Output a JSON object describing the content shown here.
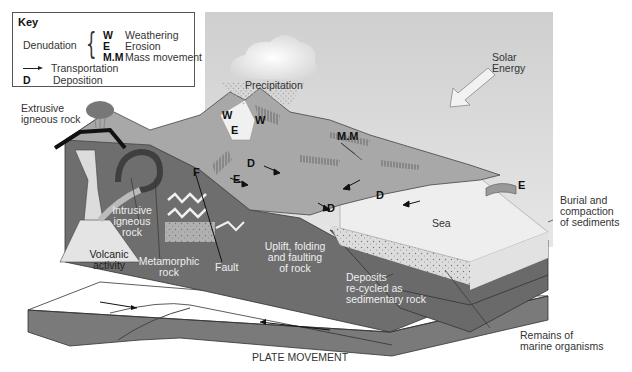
{
  "key": {
    "title": "Key",
    "denudation_label": "Denudation",
    "denudation_items": [
      {
        "symbol": "W",
        "label": "Weathering"
      },
      {
        "symbol": "E",
        "label": "Erosion"
      },
      {
        "symbol": "M.M",
        "label": "Mass movement"
      }
    ],
    "transportation": {
      "symbol": "arrow",
      "label": "Transportation"
    },
    "deposition": {
      "symbol": "D",
      "label": "Deposition"
    }
  },
  "labels": {
    "precipitation": "Precipitation",
    "solar_energy_1": "Solar",
    "solar_energy_2": "Energy",
    "extrusive_1": "Extrusive",
    "extrusive_2": "igneous rock",
    "intrusive_1": "Intrusive",
    "intrusive_2": "igneous",
    "intrusive_3": "rock",
    "volcanic_1": "Volcanic",
    "volcanic_2": "activity",
    "metamorphic_1": "Metamorphic",
    "metamorphic_2": "rock",
    "fault": "Fault",
    "uplift_1": "Uplift, folding",
    "uplift_2": "and faulting",
    "uplift_3": "of rock",
    "deposits_1": "Deposits",
    "deposits_2": "re-cycled as",
    "deposits_3": "sedimentary rock",
    "sea": "Sea",
    "burial_1": "Burial and",
    "burial_2": "compaction",
    "burial_3": "of sediments",
    "remains_1": "Remains of",
    "remains_2": "marine organisms",
    "plate_movement": "PLATE MOVEMENT"
  },
  "markers": {
    "w1": "W",
    "w2": "W",
    "e1": "E",
    "e2": "E",
    "e3": "E",
    "mm": "M.M",
    "f": "F",
    "d1": "D",
    "d2": "D",
    "d3": "D",
    "d4": "D"
  },
  "colors": {
    "sky": "#d8d8d8",
    "land": "#a9a9a9",
    "rock": "#6f6f6f",
    "sea": "#ececec",
    "plate": "#7d7d7d",
    "text": "#333333"
  }
}
